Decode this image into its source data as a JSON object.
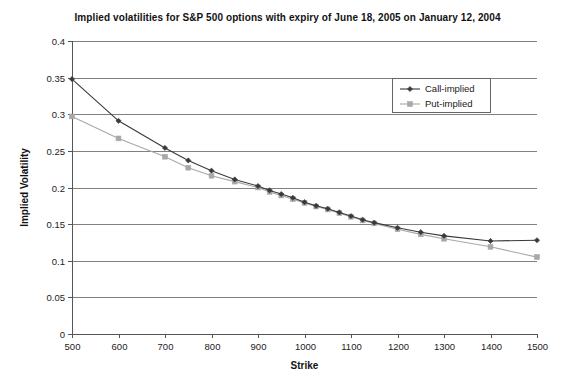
{
  "chart_data": {
    "type": "line",
    "title": "Implied volatilities for S&P 500 options with expiry of June 18, 2005 on January 12, 2004",
    "xlabel": "Strike",
    "ylabel": "Implied Volatility",
    "xlim": [
      500,
      1500
    ],
    "ylim": [
      0,
      0.4
    ],
    "xticks": [
      500,
      600,
      700,
      800,
      900,
      1000,
      1100,
      1200,
      1300,
      1400,
      1500
    ],
    "xtick_labels": [
      "500",
      "600",
      "700",
      "800",
      "900",
      "1000",
      "1100",
      "1200",
      "1300",
      "1400",
      "1500"
    ],
    "yticks": [
      0,
      0.05,
      0.1,
      0.15,
      0.2,
      0.25,
      0.3,
      0.35,
      0.4
    ],
    "ytick_labels": [
      "0",
      "0.05",
      "0.1",
      "0.15",
      "0.2",
      "0.25",
      "0.3",
      "0.35",
      "0.4"
    ],
    "grid": "horizontal",
    "legend_position": "top-right",
    "series": [
      {
        "name": "Call-implied",
        "marker": "diamond",
        "color": "#3a3a3a",
        "x": [
          500,
          600,
          700,
          750,
          800,
          850,
          900,
          925,
          950,
          975,
          1000,
          1025,
          1050,
          1075,
          1100,
          1125,
          1150,
          1200,
          1250,
          1300,
          1400,
          1500
        ],
        "y": [
          0.348,
          0.291,
          0.254,
          0.237,
          0.223,
          0.211,
          0.202,
          0.196,
          0.191,
          0.186,
          0.18,
          0.175,
          0.171,
          0.166,
          0.161,
          0.156,
          0.152,
          0.145,
          0.139,
          0.134,
          0.127,
          0.128
        ]
      },
      {
        "name": "Put-implied",
        "marker": "square",
        "color": "#a8a8a8",
        "x": [
          500,
          600,
          700,
          750,
          800,
          850,
          900,
          925,
          950,
          975,
          1000,
          1025,
          1050,
          1075,
          1100,
          1125,
          1150,
          1200,
          1250,
          1300,
          1400,
          1500
        ],
        "y": [
          0.297,
          0.267,
          0.242,
          0.227,
          0.216,
          0.208,
          0.2,
          0.194,
          0.189,
          0.184,
          0.179,
          0.174,
          0.17,
          0.165,
          0.16,
          0.155,
          0.151,
          0.143,
          0.136,
          0.13,
          0.119,
          0.105
        ]
      }
    ]
  },
  "legend": {
    "entries": [
      {
        "label": "Call-implied"
      },
      {
        "label": "Put-implied"
      }
    ]
  }
}
